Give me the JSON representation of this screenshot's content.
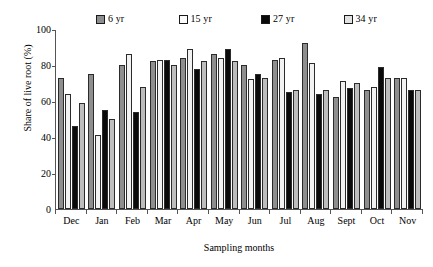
{
  "chart_data": {
    "type": "bar",
    "title": "",
    "xlabel": "Sampling months",
    "ylabel": "Share of live root (%)",
    "ylim": [
      0,
      100
    ],
    "yticks": [
      0,
      20,
      40,
      60,
      80,
      100
    ],
    "grid": false,
    "legend_position": "top",
    "categories": [
      "Dec",
      "Jan",
      "Feb",
      "Mar",
      "Apr",
      "May",
      "Jun",
      "Jul",
      "Aug",
      "Sept",
      "Oct",
      "Nov"
    ],
    "series": [
      {
        "name": "6 yr",
        "color": "#8e8e8e",
        "values": [
          73,
          75,
          80,
          82,
          84,
          86,
          80,
          83,
          92,
          62,
          66,
          73
        ]
      },
      {
        "name": "15 yr",
        "color": "#f2f2f2",
        "values": [
          64,
          41,
          86,
          83,
          89,
          84,
          72,
          84,
          81,
          71,
          68,
          73
        ]
      },
      {
        "name": "27 yr",
        "color": "#0a0a0a",
        "values": [
          46,
          55,
          54,
          83,
          78,
          89,
          75,
          65,
          64,
          67,
          79,
          66
        ]
      },
      {
        "name": "34 yr",
        "color": "#bdbdbd",
        "values": [
          59,
          50,
          68,
          80,
          82,
          82,
          73,
          66,
          66,
          70,
          73,
          66
        ]
      }
    ]
  },
  "legend": {
    "items": [
      {
        "label": "6 yr"
      },
      {
        "label": "15 yr"
      },
      {
        "label": "27 yr"
      },
      {
        "label": "34 yr"
      }
    ]
  },
  "axes": {
    "y_title": "Share of live root (%)",
    "x_title": "Sampling months",
    "y_ticks": [
      "100",
      "80",
      "60",
      "40",
      "20",
      "0"
    ]
  }
}
